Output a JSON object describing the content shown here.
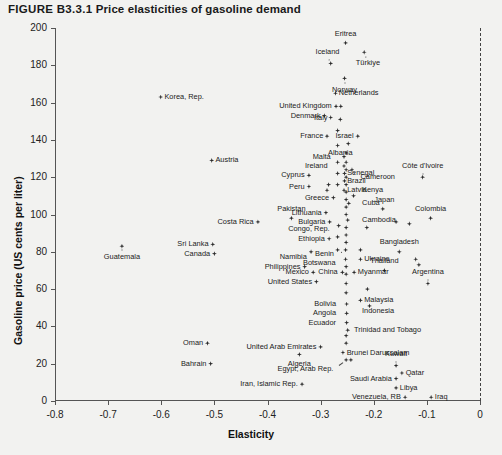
{
  "figure": {
    "number": "FIGURE B3.3.1",
    "title": "Price elasticities of gasoline demand"
  },
  "chart_data": {
    "type": "scatter",
    "title": "Price elasticities of gasoline demand",
    "xlabel": "Elasticity",
    "ylabel": "Gasoline price (US cents per liter)",
    "xlim": [
      -0.8,
      0.0
    ],
    "ylim": [
      0,
      200
    ],
    "xticks": [
      "-0.8",
      "-0.7",
      "-0.6",
      "-0.5",
      "-0.4",
      "-0.3",
      "-0.2",
      "-0.1",
      "0"
    ],
    "xtick_values": [
      -0.8,
      -0.7,
      -0.6,
      -0.5,
      -0.4,
      -0.3,
      -0.2,
      -0.1,
      0
    ],
    "yticks": [
      "0",
      "20",
      "40",
      "60",
      "80",
      "100",
      "120",
      "140",
      "160",
      "180",
      "200"
    ],
    "ytick_values": [
      0,
      20,
      40,
      60,
      80,
      100,
      120,
      140,
      160,
      180,
      200
    ],
    "grid": false,
    "legend": null,
    "reference_line": {
      "orientation": "vertical",
      "x": 0,
      "style": "dashed"
    },
    "points": [
      {
        "name": "Eritrea",
        "x": -0.253,
        "y": 192,
        "lx": -0.253,
        "ly": 197,
        "a": "c"
      },
      {
        "name": "Türkiye",
        "x": -0.218,
        "y": 187,
        "lx": -0.211,
        "ly": 181,
        "a": "c"
      },
      {
        "name": "Iceland",
        "x": -0.281,
        "y": 181,
        "lx": -0.287,
        "ly": 187,
        "a": "c"
      },
      {
        "name": "Norway",
        "x": -0.255,
        "y": 173,
        "lx": -0.255,
        "ly": 167,
        "a": "c"
      },
      {
        "name": "Netherlands",
        "x": -0.272,
        "y": 165,
        "lx": -0.266,
        "ly": 165,
        "a": "l"
      },
      {
        "name": "Korea, Rep.",
        "x": -0.601,
        "y": 163,
        "lx": -0.594,
        "ly": 163,
        "a": "l"
      },
      {
        "name": "United Kingdom",
        "x": -0.271,
        "y": 158,
        "lx": -0.279,
        "ly": 158,
        "a": "r"
      },
      {
        "name": "United Kingdom 2",
        "x": -0.262,
        "y": 158,
        "lx": null,
        "ly": null,
        "a": "c"
      },
      {
        "name": "Denmark",
        "x": -0.293,
        "y": 153,
        "lx": -0.3,
        "ly": 153,
        "a": "r"
      },
      {
        "name": "Italy",
        "x": -0.281,
        "y": 152,
        "lx": -0.287,
        "ly": 152,
        "a": "r"
      },
      {
        "name": "Italy 2",
        "x": -0.263,
        "y": 151,
        "lx": null,
        "ly": null,
        "a": "c"
      },
      {
        "name": "France",
        "x": -0.288,
        "y": 142,
        "lx": -0.295,
        "ly": 142,
        "a": "r"
      },
      {
        "name": "Israel",
        "x": -0.23,
        "y": 142,
        "lx": -0.238,
        "ly": 142,
        "a": "r"
      },
      {
        "name": "Israel 2",
        "x": -0.248,
        "y": 138,
        "lx": null,
        "ly": null,
        "a": "c"
      },
      {
        "name": "Albania",
        "x": -0.268,
        "y": 137,
        "lx": -0.263,
        "ly": 133,
        "a": "c"
      },
      {
        "name": "Malta",
        "x": -0.256,
        "y": 131,
        "lx": -0.281,
        "ly": 131,
        "a": "r"
      },
      {
        "name": "Austria",
        "x": -0.505,
        "y": 129,
        "lx": -0.498,
        "ly": 129,
        "a": "l"
      },
      {
        "name": "Ireland",
        "x": -0.256,
        "y": 126,
        "lx": -0.287,
        "ly": 126,
        "a": "r"
      },
      {
        "name": "Senegal",
        "x": -0.255,
        "y": 122,
        "lx": -0.25,
        "ly": 122,
        "a": "l"
      },
      {
        "name": "Cyprus",
        "x": -0.322,
        "y": 121,
        "lx": -0.33,
        "ly": 121,
        "a": "r"
      },
      {
        "name": "Brazil",
        "x": -0.255,
        "y": 118,
        "lx": -0.25,
        "ly": 118,
        "a": "l"
      },
      {
        "name": "Cameroon",
        "x": -0.241,
        "y": 124,
        "lx": -0.225,
        "ly": 120,
        "a": "l"
      },
      {
        "name": "Côte d'Ivoire",
        "x": -0.108,
        "y": 120,
        "lx": -0.108,
        "ly": 126,
        "a": "c"
      },
      {
        "name": "Peru",
        "x": -0.322,
        "y": 115,
        "lx": -0.33,
        "ly": 115,
        "a": "r"
      },
      {
        "name": "Latvia",
        "x": -0.256,
        "y": 113,
        "lx": -0.25,
        "ly": 113,
        "a": "l"
      },
      {
        "name": "Kenya",
        "x": -0.238,
        "y": 110,
        "lx": -0.222,
        "ly": 113,
        "a": "l"
      },
      {
        "name": "Greece",
        "x": -0.276,
        "y": 109,
        "lx": -0.284,
        "ly": 109,
        "a": "r"
      },
      {
        "name": "Cuba",
        "x": -0.247,
        "y": 106,
        "lx": -0.222,
        "ly": 106,
        "a": "l"
      },
      {
        "name": "Japan",
        "x": -0.183,
        "y": 103,
        "lx": -0.18,
        "ly": 108,
        "a": "c"
      },
      {
        "name": "Lithuania",
        "x": -0.29,
        "y": 101,
        "lx": -0.298,
        "ly": 101,
        "a": "r"
      },
      {
        "name": "Pakistan",
        "x": -0.355,
        "y": 98,
        "lx": -0.355,
        "ly": 103,
        "a": "c"
      },
      {
        "name": "Colombia",
        "x": -0.093,
        "y": 98,
        "lx": -0.093,
        "ly": 103,
        "a": "c"
      },
      {
        "name": "Cambodia",
        "x": -0.249,
        "y": 97,
        "lx": -0.222,
        "ly": 97,
        "a": "l"
      },
      {
        "name": "Bulgaria",
        "x": -0.283,
        "y": 96,
        "lx": -0.291,
        "ly": 96,
        "a": "r"
      },
      {
        "name": "Costa Rica",
        "x": -0.418,
        "y": 96,
        "lx": -0.426,
        "ly": 96,
        "a": "r"
      },
      {
        "name": "Congo, Rep.",
        "x": -0.252,
        "y": 93,
        "lx": -0.283,
        "ly": 92,
        "a": "r"
      },
      {
        "name": "unlabeled-1",
        "x": -0.266,
        "y": 94,
        "lx": null,
        "ly": null,
        "a": "c"
      },
      {
        "name": "unlabeled-2",
        "x": -0.213,
        "y": 93,
        "lx": null,
        "ly": null,
        "a": "c"
      },
      {
        "name": "unlabeled-3",
        "x": -0.158,
        "y": 96,
        "lx": null,
        "ly": null,
        "a": "c"
      },
      {
        "name": "unlabeled-4",
        "x": -0.133,
        "y": 95,
        "lx": null,
        "ly": null,
        "a": "c"
      },
      {
        "name": "Ethiopia",
        "x": -0.284,
        "y": 87,
        "lx": -0.292,
        "ly": 87,
        "a": "r"
      },
      {
        "name": "Sri Lanka",
        "x": -0.503,
        "y": 84,
        "lx": -0.511,
        "ly": 84,
        "a": "r"
      },
      {
        "name": "Guatemala",
        "x": -0.674,
        "y": 83,
        "lx": -0.674,
        "ly": 77,
        "a": "c"
      },
      {
        "name": "Benin",
        "x": -0.253,
        "y": 81,
        "lx": -0.275,
        "ly": 79,
        "a": "r"
      },
      {
        "name": "Namibia",
        "x": -0.318,
        "y": 80,
        "lx": -0.326,
        "ly": 77,
        "a": "r"
      },
      {
        "name": "Canada",
        "x": -0.5,
        "y": 79,
        "lx": -0.508,
        "ly": 79,
        "a": "r"
      },
      {
        "name": "Bangladesh",
        "x": -0.152,
        "y": 80,
        "lx": -0.152,
        "ly": 85,
        "a": "c"
      },
      {
        "name": "Botswana",
        "x": -0.253,
        "y": 76,
        "lx": -0.272,
        "ly": 74,
        "a": "r"
      },
      {
        "name": "Ukraine",
        "x": -0.225,
        "y": 76,
        "lx": -0.218,
        "ly": 76,
        "a": "l"
      },
      {
        "name": "Philippines",
        "x": -0.33,
        "y": 72,
        "lx": -0.338,
        "ly": 72,
        "a": "r"
      },
      {
        "name": "Thailand",
        "x": -0.18,
        "y": 70,
        "lx": -0.18,
        "ly": 75,
        "a": "c"
      },
      {
        "name": "unlabeled-5",
        "x": -0.121,
        "y": 76,
        "lx": null,
        "ly": null,
        "a": "c"
      },
      {
        "name": "unlabeled-6",
        "x": -0.115,
        "y": 73,
        "lx": null,
        "ly": null,
        "a": "c"
      },
      {
        "name": "Mexico",
        "x": -0.314,
        "y": 69,
        "lx": -0.322,
        "ly": 69,
        "a": "r"
      },
      {
        "name": "China",
        "x": -0.259,
        "y": 69,
        "lx": -0.268,
        "ly": 69,
        "a": "r"
      },
      {
        "name": "Myanmar",
        "x": -0.237,
        "y": 69,
        "lx": -0.23,
        "ly": 69,
        "a": "l"
      },
      {
        "name": "Argentina",
        "x": -0.098,
        "y": 63,
        "lx": -0.098,
        "ly": 69,
        "a": "c"
      },
      {
        "name": "United States",
        "x": -0.308,
        "y": 64,
        "lx": -0.316,
        "ly": 64,
        "a": "r"
      },
      {
        "name": "unlabeled-7",
        "x": -0.252,
        "y": 63,
        "lx": null,
        "ly": null,
        "a": "c"
      },
      {
        "name": "unlabeled-8",
        "x": -0.252,
        "y": 58,
        "lx": null,
        "ly": null,
        "a": "c"
      },
      {
        "name": "Malaysia",
        "x": -0.225,
        "y": 54,
        "lx": -0.218,
        "ly": 54,
        "a": "l"
      },
      {
        "name": "Bolivia",
        "x": -0.251,
        "y": 52,
        "lx": -0.271,
        "ly": 52,
        "a": "r"
      },
      {
        "name": "Indonesia",
        "x": -0.208,
        "y": 51,
        "lx": -0.222,
        "ly": 48,
        "a": "l"
      },
      {
        "name": "Angola",
        "x": -0.251,
        "y": 47,
        "lx": -0.271,
        "ly": 47,
        "a": "r"
      },
      {
        "name": "Ecuador",
        "x": -0.251,
        "y": 42,
        "lx": -0.271,
        "ly": 42,
        "a": "r"
      },
      {
        "name": "Trinidad and Tobago",
        "x": -0.249,
        "y": 38,
        "lx": -0.237,
        "ly": 38,
        "a": "l"
      },
      {
        "name": "Oman",
        "x": -0.513,
        "y": 31,
        "lx": -0.521,
        "ly": 31,
        "a": "r"
      },
      {
        "name": "United Arab Emirates",
        "x": -0.3,
        "y": 29,
        "lx": -0.308,
        "ly": 29,
        "a": "r"
      },
      {
        "name": "Brunei Darussalam",
        "x": -0.258,
        "y": 26,
        "lx": -0.251,
        "ly": 26,
        "a": "l"
      },
      {
        "name": "Algeria",
        "x": -0.34,
        "y": 25,
        "lx": -0.34,
        "ly": 20,
        "a": "c"
      },
      {
        "name": "Egypt, Arab Rep.",
        "x": -0.252,
        "y": 22,
        "lx": -0.276,
        "ly": 17,
        "a": "r"
      },
      {
        "name": "Egypt 2",
        "x": -0.243,
        "y": 22,
        "lx": null,
        "ly": null,
        "a": "c"
      },
      {
        "name": "Kuwait",
        "x": -0.158,
        "y": 19,
        "lx": -0.158,
        "ly": 25,
        "a": "c"
      },
      {
        "name": "Bahrain",
        "x": -0.507,
        "y": 20,
        "lx": -0.515,
        "ly": 20,
        "a": "r"
      },
      {
        "name": "Qatar",
        "x": -0.147,
        "y": 15,
        "lx": -0.14,
        "ly": 15,
        "a": "l"
      },
      {
        "name": "Saudi Arabia",
        "x": -0.158,
        "y": 12,
        "lx": -0.166,
        "ly": 12,
        "a": "r"
      },
      {
        "name": "Libya",
        "x": -0.158,
        "y": 7,
        "lx": -0.151,
        "ly": 7,
        "a": "l"
      },
      {
        "name": "Iran, Islamic Rep.",
        "x": -0.335,
        "y": 9,
        "lx": -0.343,
        "ly": 9,
        "a": "r"
      },
      {
        "name": "Venezuela, RB",
        "x": -0.141,
        "y": 2,
        "lx": -0.149,
        "ly": 2,
        "a": "r"
      },
      {
        "name": "Iraq",
        "x": -0.092,
        "y": 2,
        "lx": -0.085,
        "ly": 2,
        "a": "l"
      },
      {
        "name": "cluster-1",
        "x": -0.252,
        "y": 133,
        "lx": null,
        "ly": null,
        "a": "c"
      },
      {
        "name": "cluster-2",
        "x": -0.252,
        "y": 128,
        "lx": null,
        "ly": null,
        "a": "c"
      },
      {
        "name": "cluster-3",
        "x": -0.252,
        "y": 124,
        "lx": null,
        "ly": null,
        "a": "c"
      },
      {
        "name": "cluster-4",
        "x": -0.252,
        "y": 120,
        "lx": null,
        "ly": null,
        "a": "c"
      },
      {
        "name": "cluster-5",
        "x": -0.252,
        "y": 116,
        "lx": null,
        "ly": null,
        "a": "c"
      },
      {
        "name": "cluster-6",
        "x": -0.252,
        "y": 112,
        "lx": null,
        "ly": null,
        "a": "c"
      },
      {
        "name": "cluster-7",
        "x": -0.252,
        "y": 108,
        "lx": null,
        "ly": null,
        "a": "c"
      },
      {
        "name": "cluster-8",
        "x": -0.252,
        "y": 104,
        "lx": null,
        "ly": null,
        "a": "c"
      },
      {
        "name": "cluster-9",
        "x": -0.252,
        "y": 100,
        "lx": null,
        "ly": null,
        "a": "c"
      },
      {
        "name": "cluster-10",
        "x": -0.252,
        "y": 89,
        "lx": null,
        "ly": null,
        "a": "c"
      },
      {
        "name": "cluster-11",
        "x": -0.252,
        "y": 85,
        "lx": null,
        "ly": null,
        "a": "c"
      },
      {
        "name": "cluster-12",
        "x": -0.252,
        "y": 72,
        "lx": null,
        "ly": null,
        "a": "c"
      },
      {
        "name": "cluster-13",
        "x": -0.252,
        "y": 68,
        "lx": null,
        "ly": null,
        "a": "c"
      },
      {
        "name": "cluster-14",
        "x": -0.252,
        "y": 35,
        "lx": null,
        "ly": null,
        "a": "c"
      },
      {
        "name": "cluster-15",
        "x": -0.252,
        "y": 31,
        "lx": null,
        "ly": null,
        "a": "c"
      },
      {
        "name": "cluster-16",
        "x": -0.268,
        "y": 145,
        "lx": null,
        "ly": null,
        "a": "c"
      },
      {
        "name": "cluster-17",
        "x": -0.268,
        "y": 128,
        "lx": null,
        "ly": null,
        "a": "c"
      },
      {
        "name": "cluster-18",
        "x": -0.268,
        "y": 122,
        "lx": null,
        "ly": null,
        "a": "c"
      },
      {
        "name": "cluster-19",
        "x": -0.268,
        "y": 116,
        "lx": null,
        "ly": null,
        "a": "c"
      },
      {
        "name": "cluster-20",
        "x": -0.268,
        "y": 88,
        "lx": null,
        "ly": null,
        "a": "c"
      },
      {
        "name": "cluster-21",
        "x": -0.268,
        "y": 81,
        "lx": null,
        "ly": null,
        "a": "c"
      },
      {
        "name": "cluster-22",
        "x": -0.285,
        "y": 116,
        "lx": null,
        "ly": null,
        "a": "c"
      },
      {
        "name": "cluster-23",
        "x": -0.288,
        "y": 113,
        "lx": null,
        "ly": null,
        "a": "c"
      },
      {
        "name": "cluster-24",
        "x": -0.225,
        "y": 81,
        "lx": null,
        "ly": null,
        "a": "c"
      },
      {
        "name": "cluster-25",
        "x": -0.212,
        "y": 60,
        "lx": null,
        "ly": null,
        "a": "c"
      }
    ]
  }
}
